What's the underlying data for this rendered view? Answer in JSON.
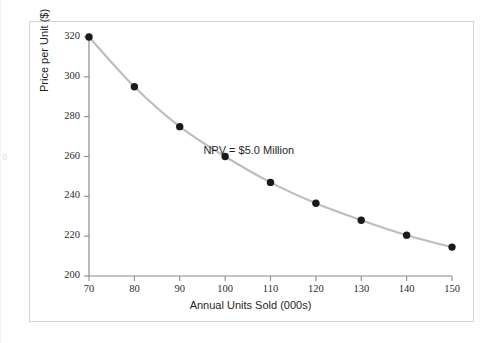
{
  "chart_data": {
    "type": "line",
    "title": "",
    "subtitle": "",
    "xlabel": "Annual Units Sold (000s)",
    "ylabel": "Price per Unit ($)",
    "xlim": [
      70,
      150
    ],
    "ylim": [
      200,
      320
    ],
    "xticks": [
      70,
      80,
      90,
      100,
      110,
      120,
      130,
      140,
      150
    ],
    "yticks": [
      200,
      220,
      240,
      260,
      280,
      300,
      320
    ],
    "xtick_labels": [
      "70",
      "80",
      "90",
      "100",
      "110",
      "120",
      "130",
      "140",
      "150"
    ],
    "ytick_labels": [
      "200",
      "220",
      "240",
      "260",
      "280",
      "300",
      "320"
    ],
    "grid": false,
    "legend": "none",
    "markers": "filled-circle",
    "marker_color": "#1a1a1a",
    "line_color": "#bdbdbd",
    "x": [
      70,
      80,
      90,
      100,
      110,
      120,
      130,
      140,
      150
    ],
    "values": [
      320,
      295,
      275,
      260,
      247,
      236.5,
      228,
      220.5,
      214.5
    ],
    "series": [
      {
        "name": "Price at constant NPV",
        "values": [
          320,
          295,
          275,
          260,
          247,
          236.5,
          228,
          220.5,
          214.5
        ]
      }
    ],
    "annotations": [
      {
        "text": "NPV = $5.0 Million",
        "x": 108,
        "y": 262
      }
    ]
  },
  "figure": {
    "frame_color": "#d3d3d3",
    "background": "#ffffff",
    "edge_artifact": "0"
  }
}
